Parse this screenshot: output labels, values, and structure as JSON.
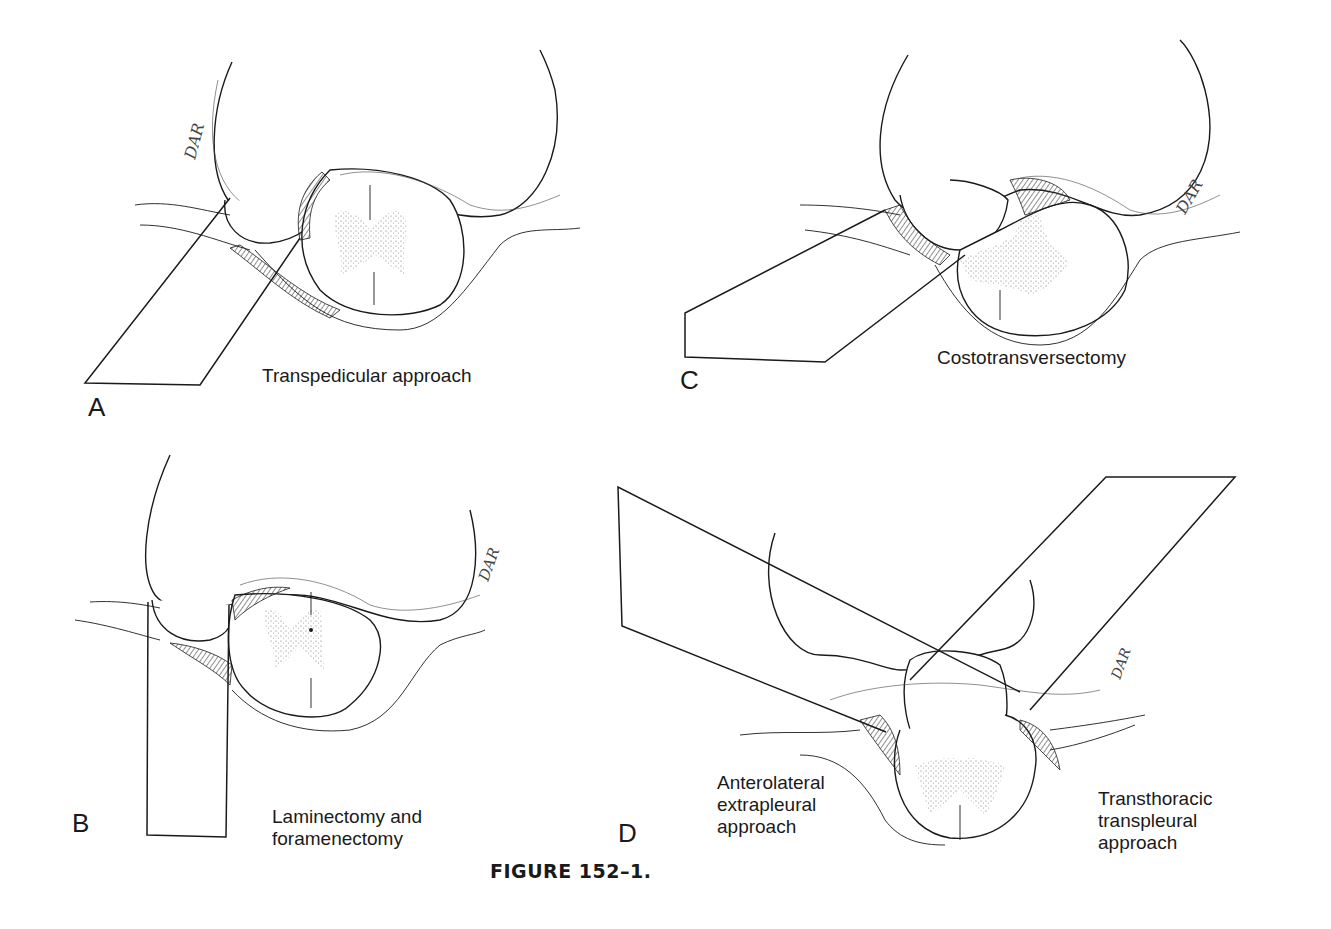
{
  "figure": {
    "caption": "FIGURE 152–1.",
    "signature": "DAR"
  },
  "panels": [
    {
      "letter": "A",
      "label_lines": [
        "Transpedicular approach"
      ]
    },
    {
      "letter": "B",
      "label_lines": [
        "Laminectomy and",
        "foramenectomy"
      ]
    },
    {
      "letter": "C",
      "label_lines": [
        "Costotransversectomy"
      ]
    },
    {
      "letter": "D",
      "label_lines": [
        "Anterolateral",
        "extrapleural",
        "approach"
      ],
      "label_lines_right": [
        "Transthoracic",
        "transpleural",
        "approach"
      ]
    }
  ],
  "colors": {
    "ink": "#1a1a1a",
    "background": "#ffffff"
  }
}
